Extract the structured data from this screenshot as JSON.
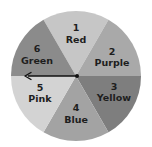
{
  "spinner": {
    "center": [
      76,
      76
    ],
    "radius": 65,
    "pointer": {
      "direction": "left",
      "points_to_segment": "5-6 boundary"
    },
    "segments": [
      {
        "number": "1",
        "label": "Red",
        "shade": "#c6c6c6"
      },
      {
        "number": "2",
        "label": "Purple",
        "shade": "#a9a9a9"
      },
      {
        "number": "3",
        "label": "Yellow",
        "shade": "#7e7e7e"
      },
      {
        "number": "4",
        "label": "Blue",
        "shade": "#a3a3a3"
      },
      {
        "number": "5",
        "label": "Pink",
        "shade": "#d3d3d3"
      },
      {
        "number": "6",
        "label": "Green",
        "shade": "#8b8b8b"
      }
    ]
  }
}
